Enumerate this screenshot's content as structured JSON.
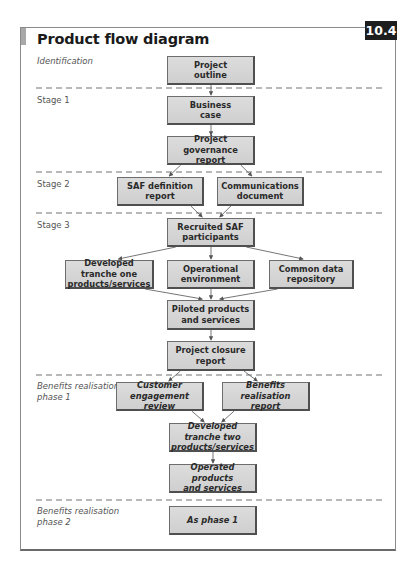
{
  "figure": {
    "title": "Product flow diagram",
    "number": "10.4"
  },
  "stages": [
    {
      "id": "identification",
      "label": "Identification",
      "italic": true
    },
    {
      "id": "stage1",
      "label": "Stage 1",
      "italic": false
    },
    {
      "id": "stage2",
      "label": "Stage 2",
      "italic": false
    },
    {
      "id": "stage3",
      "label": "Stage 3",
      "italic": false
    },
    {
      "id": "brp1",
      "label": "Benefits realisation phase 1",
      "line1": "Benefits realisation",
      "line2": "phase 1",
      "italic": true
    },
    {
      "id": "brp2",
      "label": "Benefits realisation phase 2",
      "line1": "Benefits realisation",
      "line2": "phase 2",
      "italic": true
    }
  ],
  "nodes": {
    "project_outline": {
      "line1": "Project",
      "line2": "outline",
      "italic": true
    },
    "business_case": {
      "line1": "Business",
      "line2": "case",
      "italic": false
    },
    "project_governance_report": {
      "line1": "Project governance",
      "line2": "report",
      "italic": false
    },
    "saf_definition_report": {
      "line1": "SAF definition",
      "line2": "report",
      "italic": false
    },
    "communications_document": {
      "line1": "Communications",
      "line2": "document",
      "italic": false
    },
    "recruited_saf_participants": {
      "line1": "Recruited SAF",
      "line2": "participants",
      "italic": false
    },
    "developed_tranche_one": {
      "line1": "Developed tranche one",
      "line2": "products/services",
      "italic": false
    },
    "operational_environment": {
      "line1": "Operational",
      "line2": "environment",
      "italic": false
    },
    "common_data_repository": {
      "line1": "Common data",
      "line2": "repository",
      "italic": false
    },
    "piloted_products": {
      "line1": "Piloted products",
      "line2": "and services",
      "italic": false
    },
    "project_closure_report": {
      "line1": "Project closure",
      "line2": "report",
      "italic": false
    },
    "customer_engagement_review": {
      "line1": "Customer engagement",
      "line2": "review",
      "italic": true
    },
    "benefits_realisation_report": {
      "line1": "Benefits realisation",
      "line2": "report",
      "italic": true
    },
    "developed_tranche_two": {
      "line1": "Developed tranche two",
      "line2": "products/services",
      "italic": true
    },
    "operated_products": {
      "line1": "Operated products",
      "line2": "and services",
      "italic": true
    },
    "as_phase_1": {
      "line1": "As phase 1",
      "line2": "",
      "italic": true
    }
  },
  "edges": [
    [
      "project_outline",
      "business_case"
    ],
    [
      "business_case",
      "project_governance_report"
    ],
    [
      "project_governance_report",
      "saf_definition_report"
    ],
    [
      "project_governance_report",
      "communications_document"
    ],
    [
      "saf_definition_report",
      "recruited_saf_participants"
    ],
    [
      "communications_document",
      "recruited_saf_participants"
    ],
    [
      "recruited_saf_participants",
      "developed_tranche_one"
    ],
    [
      "recruited_saf_participants",
      "operational_environment"
    ],
    [
      "recruited_saf_participants",
      "common_data_repository"
    ],
    [
      "developed_tranche_one",
      "piloted_products"
    ],
    [
      "operational_environment",
      "piloted_products"
    ],
    [
      "common_data_repository",
      "piloted_products"
    ],
    [
      "piloted_products",
      "project_closure_report"
    ],
    [
      "project_closure_report",
      "customer_engagement_review"
    ],
    [
      "project_closure_report",
      "benefits_realisation_report"
    ],
    [
      "customer_engagement_review",
      "developed_tranche_two"
    ],
    [
      "benefits_realisation_report",
      "developed_tranche_two"
    ],
    [
      "developed_tranche_two",
      "operated_products"
    ]
  ]
}
